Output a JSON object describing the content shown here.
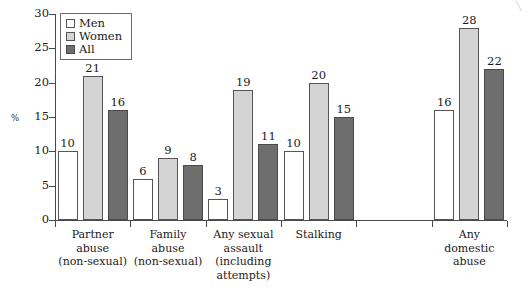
{
  "chart_data": {
    "type": "bar",
    "title": "",
    "xlabel": "",
    "ylabel": "%",
    "ylim": [
      0,
      30
    ],
    "yticks": [
      0,
      5,
      10,
      15,
      20,
      25,
      30
    ],
    "grid": false,
    "legend_position": "top-left",
    "categories": [
      "Partner abuse (non-sexual)",
      "Family abuse (non-sexual)",
      "Any sexual assault (including attempts)",
      "Stalking",
      "",
      "Any domestic abuse"
    ],
    "category_lines": [
      [
        "Partner",
        "abuse",
        "(non-sexual)"
      ],
      [
        "Family",
        "abuse",
        "(non-sexual)"
      ],
      [
        "Any sexual",
        "assault",
        "(including",
        "attempts)"
      ],
      [
        "Stalking"
      ],
      [],
      [
        "Any",
        "domestic",
        "abuse"
      ]
    ],
    "series": [
      {
        "name": "Men",
        "color": "#ffffff",
        "values": [
          10,
          6,
          3,
          10,
          null,
          16
        ]
      },
      {
        "name": "Women",
        "color": "#d4d4d4",
        "values": [
          21,
          9,
          19,
          20,
          null,
          28
        ]
      },
      {
        "name": "All",
        "color": "#6e6e6e",
        "values": [
          16,
          8,
          11,
          15,
          null,
          22
        ]
      }
    ]
  },
  "legend": {
    "items": [
      {
        "label": "Men",
        "swatch": "men"
      },
      {
        "label": "Women",
        "swatch": "women"
      },
      {
        "label": "All",
        "swatch": "all"
      }
    ]
  },
  "axis": {
    "y_unit_label": "%",
    "y_tick_labels": [
      "30",
      "25",
      "20",
      "15",
      "10",
      "5",
      "0"
    ]
  },
  "corner": {
    "mark": "╲"
  }
}
